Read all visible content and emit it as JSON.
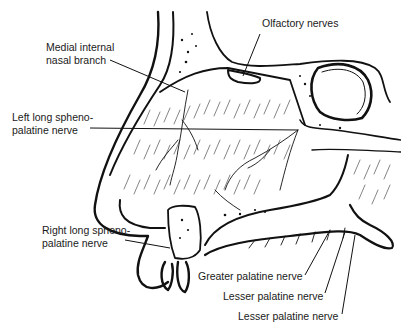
{
  "figure": {
    "labels": {
      "olfactory": "Olfactory nerves",
      "medial_internal_1": "Medial internal",
      "medial_internal_2": "nasal branch",
      "left_long_1": "Left long spheno-",
      "left_long_2": "palatine nerve",
      "right_long_1": "Right long spheno-",
      "right_long_2": "palatine nerve",
      "greater_palatine": "Greater palatine nerve",
      "lesser_palatine_1": "Lesser palatine nerve",
      "lesser_palatine_2": "Lesser palatine nerve"
    },
    "colors": {
      "ink": "#111111",
      "background": "#ffffff"
    }
  }
}
